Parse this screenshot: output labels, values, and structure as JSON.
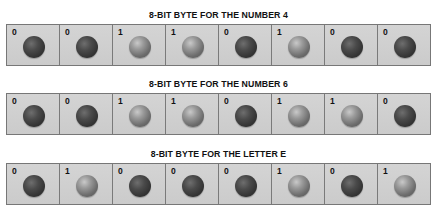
{
  "bytes": [
    {
      "title": "8-BIT BYTE FOR THE NUMBER 4",
      "bits": [
        "0",
        "0",
        "1",
        "1",
        "0",
        "1",
        "0",
        "0"
      ]
    },
    {
      "title": "8-BIT BYTE FOR THE NUMBER 6",
      "bits": [
        "0",
        "0",
        "1",
        "1",
        "0",
        "1",
        "1",
        "0"
      ]
    },
    {
      "title": "8-BIT BYTE FOR THE LETTER E",
      "bits": [
        "0",
        "1",
        "0",
        "0",
        "0",
        "1",
        "0",
        "1"
      ]
    }
  ],
  "colors": {
    "cell_fill": "#cfcfcf",
    "cell_border": "#7a7a7a",
    "sphere_off": "#333333",
    "sphere_on": "#8a8a8a",
    "title_text": "#111111"
  }
}
